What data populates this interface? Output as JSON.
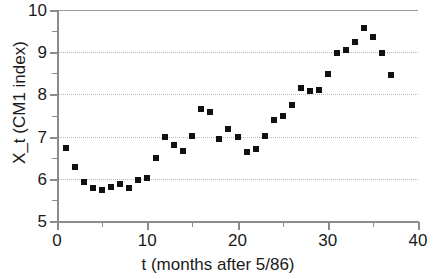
{
  "chart_data": {
    "type": "scatter",
    "title": "",
    "xlabel": "t (months after 5/86)",
    "ylabel": "X_t (CM1 index)",
    "xlim": [
      0,
      40
    ],
    "ylim": [
      5,
      10
    ],
    "xticks": [
      0,
      10,
      20,
      30,
      40
    ],
    "xtick_labels": [
      "0",
      "10",
      "20",
      "30",
      "40"
    ],
    "xticks_minor": [
      5,
      15,
      25,
      35
    ],
    "yticks": [
      5,
      6,
      7,
      8,
      9,
      10
    ],
    "ytick_labels": [
      "5",
      "6",
      "7",
      "8",
      "9",
      "10"
    ],
    "yticks_minor": [
      5.5,
      6.5,
      7.5,
      8.5,
      9.5
    ],
    "grid": "horizontal-dotted",
    "legend": null,
    "marker": "square",
    "marker_color": "#111111",
    "marker_size_px": 6,
    "x": [
      1,
      2,
      3,
      4,
      5,
      6,
      7,
      8,
      9,
      10,
      11,
      12,
      13,
      14,
      15,
      16,
      17,
      18,
      19,
      20,
      21,
      22,
      23,
      24,
      25,
      26,
      27,
      28,
      29,
      30,
      31,
      32,
      33,
      34,
      35,
      36,
      37
    ],
    "values": [
      6.72,
      6.27,
      5.93,
      5.78,
      5.73,
      5.8,
      5.87,
      5.79,
      5.96,
      6.03,
      6.5,
      6.99,
      6.79,
      6.67,
      7.02,
      7.66,
      7.59,
      6.95,
      7.17,
      6.98,
      6.64,
      6.71,
      7.01,
      7.39,
      7.48,
      7.74,
      8.16,
      8.08,
      8.1,
      8.48,
      8.99,
      9.05,
      9.23,
      9.57,
      9.35,
      8.98,
      8.45
    ]
  },
  "axis": {
    "x_title": "t (months after 5/86)",
    "y_title": "X_t (CM1 index)"
  },
  "colors": {
    "marker": "#111111",
    "axis": "#8c8c8c",
    "grid": "#b9b9b9",
    "text": "#1a1a1a",
    "background": "#ffffff"
  }
}
